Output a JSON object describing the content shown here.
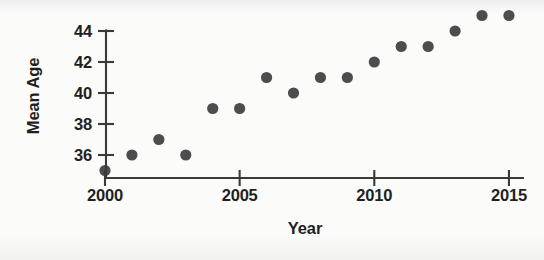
{
  "chart_data": {
    "type": "scatter",
    "title": "",
    "xlabel": "Year",
    "ylabel": "Mean Age",
    "x": [
      2000,
      2001,
      2002,
      2003,
      2004,
      2005,
      2006,
      2007,
      2008,
      2009,
      2010,
      2011,
      2012,
      2013,
      2014,
      2015
    ],
    "values": [
      35,
      36,
      37,
      36,
      39,
      39,
      41,
      40,
      41,
      41,
      42,
      43,
      43,
      44,
      45,
      45
    ],
    "series": [
      {
        "name": "Mean Age",
        "values": [
          35,
          36,
          37,
          36,
          39,
          39,
          41,
          40,
          41,
          41,
          42,
          43,
          43,
          44,
          45,
          45
        ]
      }
    ],
    "xlim": [
      1999.6,
      2015.6
    ],
    "ylim": [
      34.6,
      45.6
    ],
    "xticks": [
      2000,
      2005,
      2010,
      2015
    ],
    "xtick_labels": [
      "2000",
      "2005",
      "2010",
      "2015"
    ],
    "yticks": [
      36,
      38,
      40,
      42,
      44
    ],
    "ytick_labels": [
      "36",
      "38",
      "40",
      "42",
      "44"
    ],
    "grid": false,
    "legend": false,
    "legend_position": "none",
    "marker": "filled-circle",
    "marker_color": "#4d4d4d",
    "axis_color": "#3a3a3a",
    "background_color": "#fbfbfa",
    "text_color": "#1f1f1f"
  },
  "labels": {
    "x_axis_title": "Year",
    "y_axis_title": "Mean Age"
  }
}
